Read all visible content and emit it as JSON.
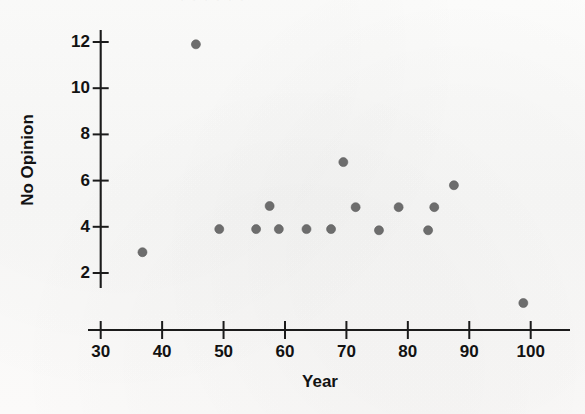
{
  "figure": {
    "scan_artifact_text": "·  ·   ·    ·  ·   ·",
    "dot_color": "#6d6d6d",
    "axis_color": "#1b1b1b",
    "background_color": "#fbfbfa"
  },
  "chart_data": {
    "type": "scatter",
    "title": "",
    "subtitle": "",
    "xlabel": "Year",
    "ylabel": "No Opinion",
    "xlim": [
      28,
      105
    ],
    "ylim": [
      0,
      13
    ],
    "grid": false,
    "legend": null,
    "xticks": [
      30,
      40,
      50,
      60,
      70,
      80,
      90,
      100
    ],
    "xtick_labels": [
      "30",
      "40",
      "50",
      "60",
      "70",
      "80",
      "90",
      "100"
    ],
    "yticks": [
      2,
      4,
      6,
      8,
      10,
      12
    ],
    "ytick_labels": [
      "2",
      "4",
      "6",
      "8",
      "10",
      "12"
    ],
    "marker": "filled-circle",
    "marker_size_px": 9,
    "points": [
      {
        "x": 36.8,
        "y": 2.9
      },
      {
        "x": 45.5,
        "y": 11.9
      },
      {
        "x": 49.3,
        "y": 3.9
      },
      {
        "x": 55.3,
        "y": 3.9
      },
      {
        "x": 57.5,
        "y": 4.9
      },
      {
        "x": 59.0,
        "y": 3.9
      },
      {
        "x": 63.5,
        "y": 3.9
      },
      {
        "x": 67.5,
        "y": 3.9
      },
      {
        "x": 69.5,
        "y": 6.8
      },
      {
        "x": 71.5,
        "y": 4.85
      },
      {
        "x": 75.3,
        "y": 3.85
      },
      {
        "x": 78.5,
        "y": 4.85
      },
      {
        "x": 83.3,
        "y": 3.85
      },
      {
        "x": 84.3,
        "y": 4.85
      },
      {
        "x": 87.5,
        "y": 5.8
      },
      {
        "x": 98.8,
        "y": 0.7
      }
    ]
  }
}
